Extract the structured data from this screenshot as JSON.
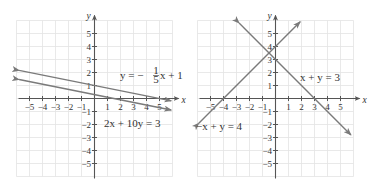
{
  "colors": {
    "grid": "#e3e3e3",
    "axis": "#555555",
    "line": "#7a7a7a",
    "text": "#333333"
  },
  "chart_data": [
    {
      "type": "line",
      "title": "",
      "xlabel": "x",
      "ylabel": "y",
      "xlim": [
        -6,
        6
      ],
      "ylim": [
        -6,
        6
      ],
      "grid": true,
      "x_ticks": [
        -5,
        -4,
        -3,
        -2,
        -1,
        1,
        2,
        3,
        4,
        5
      ],
      "y_ticks": [
        -5,
        -4,
        -3,
        -2,
        -1,
        1,
        2,
        3,
        4,
        5
      ],
      "series": [
        {
          "name": "y = -1/5 x + 1",
          "label": "y = −(1/5)x + 1",
          "slope": -0.2,
          "intercept": 1,
          "x_range": [
            -5.8,
            5.9
          ],
          "points": [
            [
              -5.8,
              2.16
            ],
            [
              0,
              1
            ],
            [
              5,
              0
            ],
            [
              5.9,
              -0.18
            ]
          ]
        },
        {
          "name": "2x + 10y = 3",
          "label": "2x + 10y = 3",
          "slope": -0.2,
          "intercept": 0.3,
          "x_range": [
            -5.8,
            5.9
          ],
          "points": [
            [
              -5.8,
              1.46
            ],
            [
              0,
              0.3
            ],
            [
              1.5,
              0
            ],
            [
              5.9,
              -0.88
            ]
          ]
        }
      ],
      "annotations": [
        {
          "text": "y = −(1/5)x + 1",
          "x": 1,
          "y": 1.5
        },
        {
          "text": "2x + 10y = 3",
          "x": 0.5,
          "y": -1.5
        }
      ]
    },
    {
      "type": "line",
      "title": "",
      "xlabel": "x",
      "ylabel": "y",
      "xlim": [
        -6,
        6
      ],
      "ylim": [
        -6,
        6
      ],
      "grid": true,
      "x_ticks": [
        -5,
        -4,
        -3,
        -2,
        -1,
        1,
        2,
        3,
        4,
        5
      ],
      "y_ticks": [
        -5,
        -4,
        -3,
        -2,
        -1,
        1,
        2,
        3,
        4,
        5
      ],
      "series": [
        {
          "name": "x + y = 3",
          "label": "x + y = 3",
          "slope": -1,
          "intercept": 3,
          "x_range": [
            -2.8,
            5.8
          ],
          "points": [
            [
              -2.8,
              5.8
            ],
            [
              0,
              3
            ],
            [
              3,
              0
            ],
            [
              5.8,
              -2.8
            ]
          ]
        },
        {
          "name": "-x + y = 4",
          "label": "−x + y = 4",
          "slope": 1,
          "intercept": 4,
          "x_range": [
            -5.9,
            1.9
          ],
          "points": [
            [
              -5.9,
              -1.9
            ],
            [
              -4,
              0
            ],
            [
              0,
              4
            ],
            [
              1.9,
              5.9
            ]
          ]
        }
      ],
      "annotations": [
        {
          "text": "x + y = 3",
          "x": 2,
          "y": 1.5
        },
        {
          "text": "−x + y = 4",
          "x": -6,
          "y": -2
        }
      ],
      "intersection": [
        -0.5,
        3.5
      ]
    }
  ],
  "graphs": [
    {
      "origin": [
        94.5,
        98.5
      ],
      "unit": 13,
      "grid_extent": [
        -6,
        6
      ],
      "labels": [
        {
          "kind": "eq-frac",
          "x": 120,
          "y": 79,
          "pre": "y = −",
          "num": "1",
          "den": "5",
          "post": "x + 1"
        },
        {
          "kind": "eq",
          "x": 104,
          "y": 127,
          "text": "2x + 10y = 3"
        }
      ]
    },
    {
      "origin": [
        275.5,
        98.5
      ],
      "unit": 13,
      "grid_extent": [
        -6,
        6
      ],
      "labels": [
        {
          "kind": "eq",
          "x": 300,
          "y": 81,
          "text": "x + y = 3"
        },
        {
          "kind": "eq",
          "x": 196,
          "y": 130,
          "text": "−x + y = 4"
        }
      ]
    }
  ]
}
